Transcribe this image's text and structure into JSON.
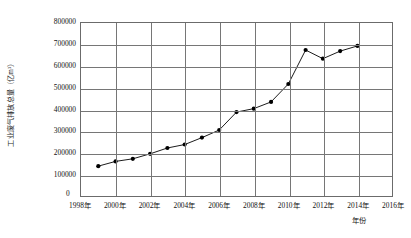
{
  "chart_data": {
    "type": "line",
    "title": "",
    "subtitle": "",
    "xlabel": "年份",
    "ylabel": "工业废气排放总量（亿m³）",
    "grid": true,
    "legend": false,
    "marker": "filled-circle",
    "xlim": [
      1998,
      2016
    ],
    "ylim": [
      0,
      800000
    ],
    "ytick_step": 100000,
    "xtick_step": 2,
    "xticks": [
      "1998年",
      "2000年",
      "2002年",
      "2004年",
      "2006年",
      "2008年",
      "2010年",
      "2012年",
      "2014年",
      "2016年"
    ],
    "xtick_values": [
      1998,
      2000,
      2002,
      2004,
      2006,
      2008,
      2010,
      2012,
      2014,
      2016
    ],
    "yticks": [
      "0",
      "100000",
      "200000",
      "300000",
      "400000",
      "500000",
      "600000",
      "700000",
      "800000"
    ],
    "ytick_values": [
      0,
      100000,
      200000,
      300000,
      400000,
      500000,
      600000,
      700000,
      800000
    ],
    "x": [
      1999,
      2000,
      2001,
      2002,
      2003,
      2004,
      2005,
      2006,
      2007,
      2008,
      2009,
      2010,
      2011,
      2012,
      2013,
      2014
    ],
    "values": [
      138000,
      160000,
      172000,
      195000,
      222000,
      238000,
      270000,
      305000,
      388000,
      404000,
      435000,
      518000,
      675000,
      635000,
      670000,
      694000
    ],
    "series": [
      {
        "name": "工业废气排放总量",
        "color": "#000000",
        "values": [
          138000,
          160000,
          172000,
          195000,
          222000,
          238000,
          270000,
          305000,
          388000,
          404000,
          435000,
          518000,
          675000,
          635000,
          670000,
          694000
        ]
      }
    ]
  },
  "axis": {
    "zero_label": "0"
  },
  "style": {
    "line_color": "#1a1a1a",
    "marker_color": "#000000",
    "grid_color": "#767676",
    "frame_color": "#6b6b6b",
    "background": "#ffffff"
  }
}
